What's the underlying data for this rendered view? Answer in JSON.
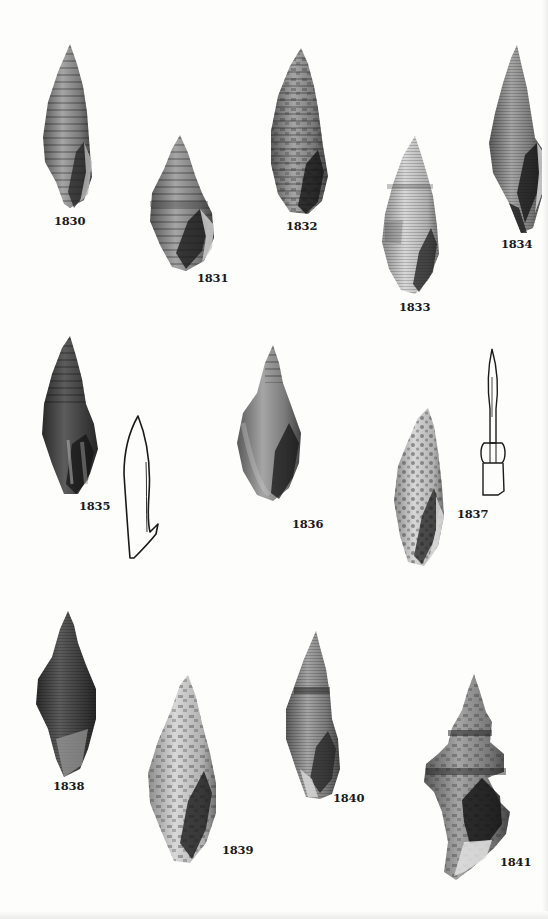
{
  "plate": {
    "figures": [
      {
        "id": "1830",
        "label": "1830",
        "kind": "shell-photo"
      },
      {
        "id": "1831",
        "label": "1831",
        "kind": "shell-photo"
      },
      {
        "id": "1832",
        "label": "1832",
        "kind": "shell-photo"
      },
      {
        "id": "1833",
        "label": "1833",
        "kind": "shell-photo"
      },
      {
        "id": "1834",
        "label": "1834",
        "kind": "shell-photo"
      },
      {
        "id": "1835",
        "label": "1835",
        "kind": "shell-photo-with-operculum-drawing"
      },
      {
        "id": "1836",
        "label": "1836",
        "kind": "shell-photo"
      },
      {
        "id": "1837",
        "label": "1837",
        "kind": "shell-photo-with-radula-tooth-drawing"
      },
      {
        "id": "1838",
        "label": "1838",
        "kind": "shell-photo"
      },
      {
        "id": "1839",
        "label": "1839",
        "kind": "shell-photo"
      },
      {
        "id": "1840",
        "label": "1840",
        "kind": "shell-photo"
      },
      {
        "id": "1841",
        "label": "1841",
        "kind": "shell-photo"
      }
    ]
  }
}
